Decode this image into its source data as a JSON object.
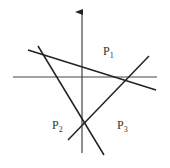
{
  "diagram": {
    "axes": {
      "vertical": {
        "x": 82,
        "y1": 153,
        "y2": 12,
        "arrow": true
      },
      "horizontal": {
        "y": 77,
        "x1": 13,
        "x2": 157
      }
    },
    "lines": [
      {
        "name": "line-a",
        "x1": 28,
        "y1": 50,
        "x2": 156,
        "y2": 90
      },
      {
        "name": "line-b",
        "x1": 38,
        "y1": 46,
        "x2": 104,
        "y2": 155
      },
      {
        "name": "line-c",
        "x1": 68,
        "y1": 140,
        "x2": 149,
        "y2": 56
      }
    ],
    "labels": [
      {
        "name": "label-p1",
        "base": "P",
        "sub": "1",
        "x": 103,
        "y": 55
      },
      {
        "name": "label-p2",
        "base": "P",
        "sub": "2",
        "x": 52,
        "y": 129
      },
      {
        "name": "label-p3",
        "base": "P",
        "sub": "3",
        "x": 117,
        "y": 129
      }
    ],
    "colors": {
      "stroke": "#222222",
      "axis": "#444444",
      "text": "#333333"
    }
  }
}
